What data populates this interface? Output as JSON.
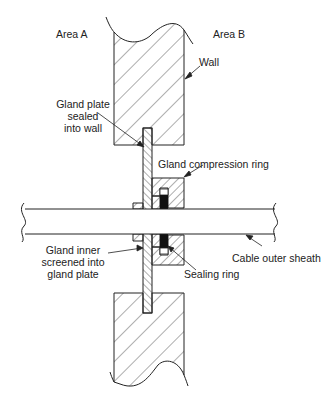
{
  "diagram": {
    "type": "cross-section",
    "labels": {
      "area_a": "Area A",
      "area_b": "Area B",
      "wall": "Wall",
      "gland_plate_1": "Gland plate",
      "gland_plate_2": "sealed",
      "gland_plate_3": "into wall",
      "compression_ring": "Gland compression ring",
      "gland_inner_1": "Gland inner",
      "gland_inner_2": "screened into",
      "gland_inner_3": "gland plate",
      "cable_sheath": "Cable outer sheath",
      "sealing_ring": "Sealing ring"
    },
    "colors": {
      "line": "#222222",
      "fill": "#ffffff",
      "seal": "#111111"
    }
  }
}
